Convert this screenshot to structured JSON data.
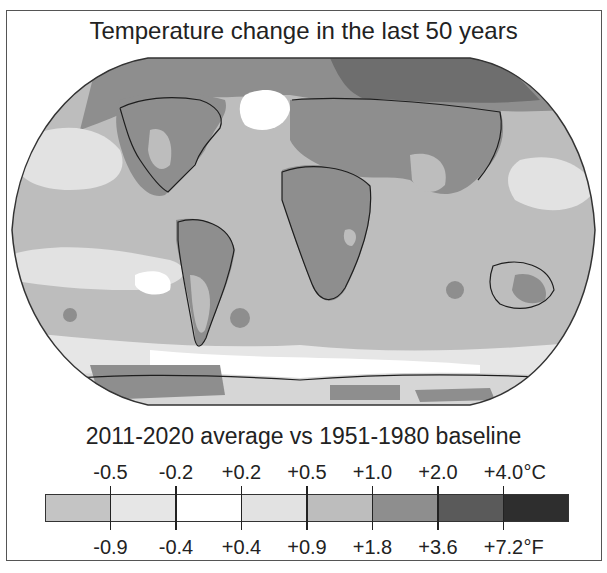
{
  "title": "Temperature change in the last 50 years",
  "subtitle": "2011-2020 average vs 1951-1980 baseline",
  "legend": {
    "celsius_ticks": [
      "-0.5",
      "-0.2",
      "+0.2",
      "+0.5",
      "+1.0",
      "+2.0",
      "+4.0"
    ],
    "celsius_unit": "°C",
    "fahrenheit_ticks": [
      "-0.9",
      "-0.4",
      "+0.4",
      "+0.9",
      "+1.8",
      "+3.6",
      "+7.2"
    ],
    "fahrenheit_unit": "°F",
    "bins": [
      {
        "range_c": "< -0.5",
        "color": "#c4c4c4"
      },
      {
        "range_c": "-0.5 to -0.2",
        "color": "#e6e6e6"
      },
      {
        "range_c": "-0.2 to +0.2",
        "color": "#ffffff"
      },
      {
        "range_c": "+0.2 to +0.5",
        "color": "#e2e2e2"
      },
      {
        "range_c": "+0.5 to +1.0",
        "color": "#bdbdbd"
      },
      {
        "range_c": "+1.0 to +2.0",
        "color": "#8e8e8e"
      },
      {
        "range_c": "+2.0 to +4.0",
        "color": "#5a5a5a"
      },
      {
        "range_c": "> +4.0",
        "color": "#2e2e2e"
      }
    ]
  },
  "map": {
    "projection": "Robinson",
    "colormap": "grayscale",
    "regions": [
      {
        "name": "Arctic / northern Siberia",
        "bin": 6
      },
      {
        "name": "Northern Eurasia",
        "bin": 5
      },
      {
        "name": "North America interior",
        "bin": 5
      },
      {
        "name": "Canada / Alaska north",
        "bin": 6
      },
      {
        "name": "North Atlantic south of Greenland",
        "bin": 2
      },
      {
        "name": "Africa",
        "bin": 5
      },
      {
        "name": "Middle East / South Asia",
        "bin": 5
      },
      {
        "name": "South America interior",
        "bin": 5
      },
      {
        "name": "Australia interior",
        "bin": 5
      },
      {
        "name": "Indian Ocean",
        "bin": 4
      },
      {
        "name": "Eastern Pacific",
        "bin": 3
      },
      {
        "name": "Southern Ocean",
        "bin": 2
      },
      {
        "name": "Antarctica (West)",
        "bin": 5
      },
      {
        "name": "Antarctica (East)",
        "bin": 3
      }
    ]
  }
}
